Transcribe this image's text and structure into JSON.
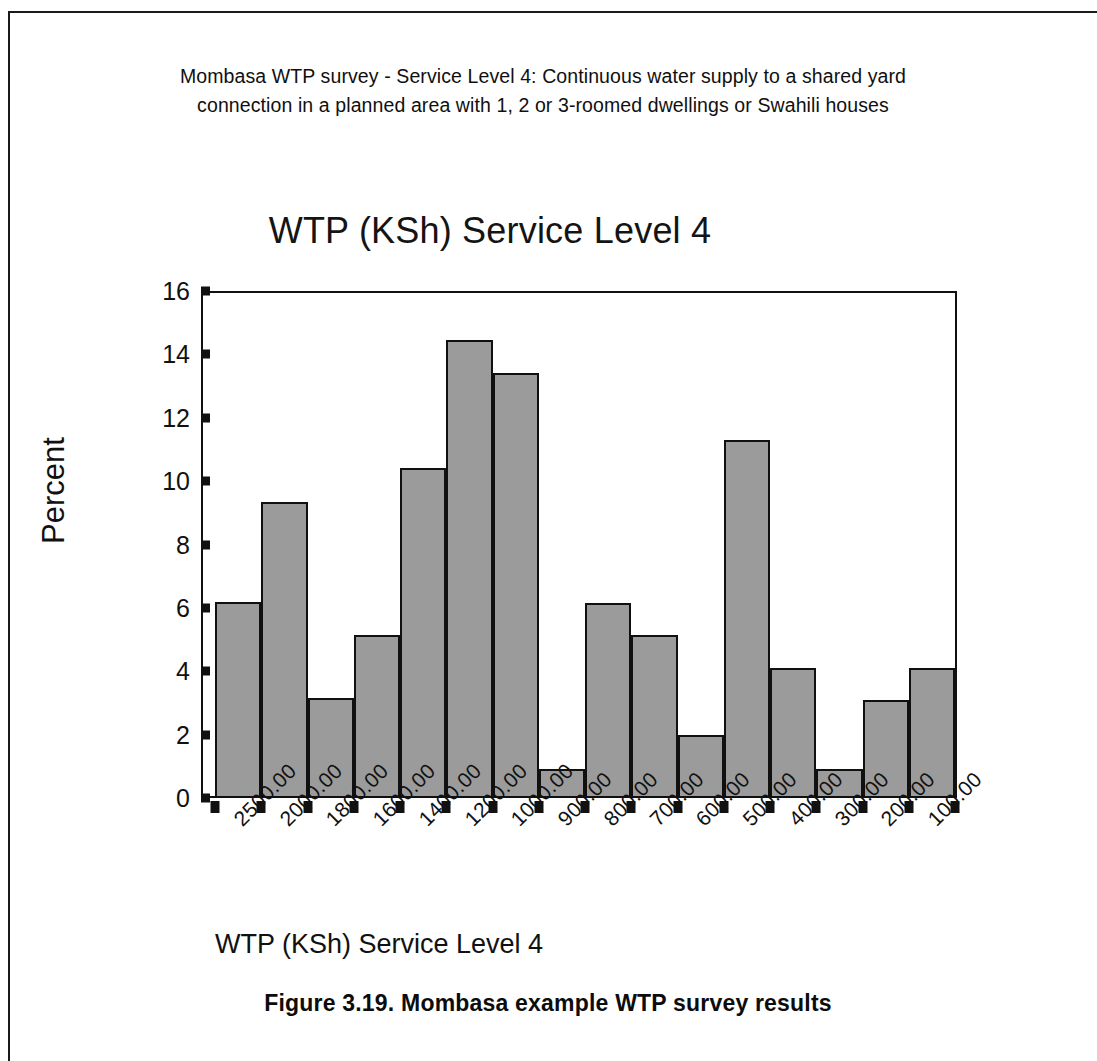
{
  "page": {
    "header_caption": "Mombasa WTP survey - Service Level 4: Continuous water supply to a shared yard connection in a planned area with 1, 2 or 3-roomed dwellings or Swahili houses",
    "figure_caption": "Figure 3.19. Mombasa example WTP survey results"
  },
  "chart_data": {
    "type": "bar",
    "title": "WTP (KSh) Service Level 4",
    "xlabel": "WTP (KSh) Service Level 4",
    "ylabel": "Percent",
    "ylim": [
      0,
      16
    ],
    "ytick_step": 2,
    "yticks": [
      "16",
      "14",
      "12",
      "10",
      "8",
      "6",
      "4",
      "2",
      "0"
    ],
    "grid": false,
    "legend": null,
    "bar_fill_color": "#9b9b9b",
    "bar_edge_color": "#101010",
    "categories": [
      "2500.00",
      "2000.00",
      "1800.00",
      "1600.00",
      "1400.00",
      "1200.00",
      "1000.00",
      "900.00",
      "800.00",
      "700.00",
      "600.00",
      "500.00",
      "400.00",
      "300.00",
      "200.00",
      "100.00"
    ],
    "values": [
      6.2,
      9.35,
      3.15,
      5.15,
      10.4,
      14.45,
      13.4,
      0.9,
      6.15,
      5.15,
      2.0,
      11.3,
      4.1,
      0.9,
      3.1,
      4.1
    ]
  }
}
